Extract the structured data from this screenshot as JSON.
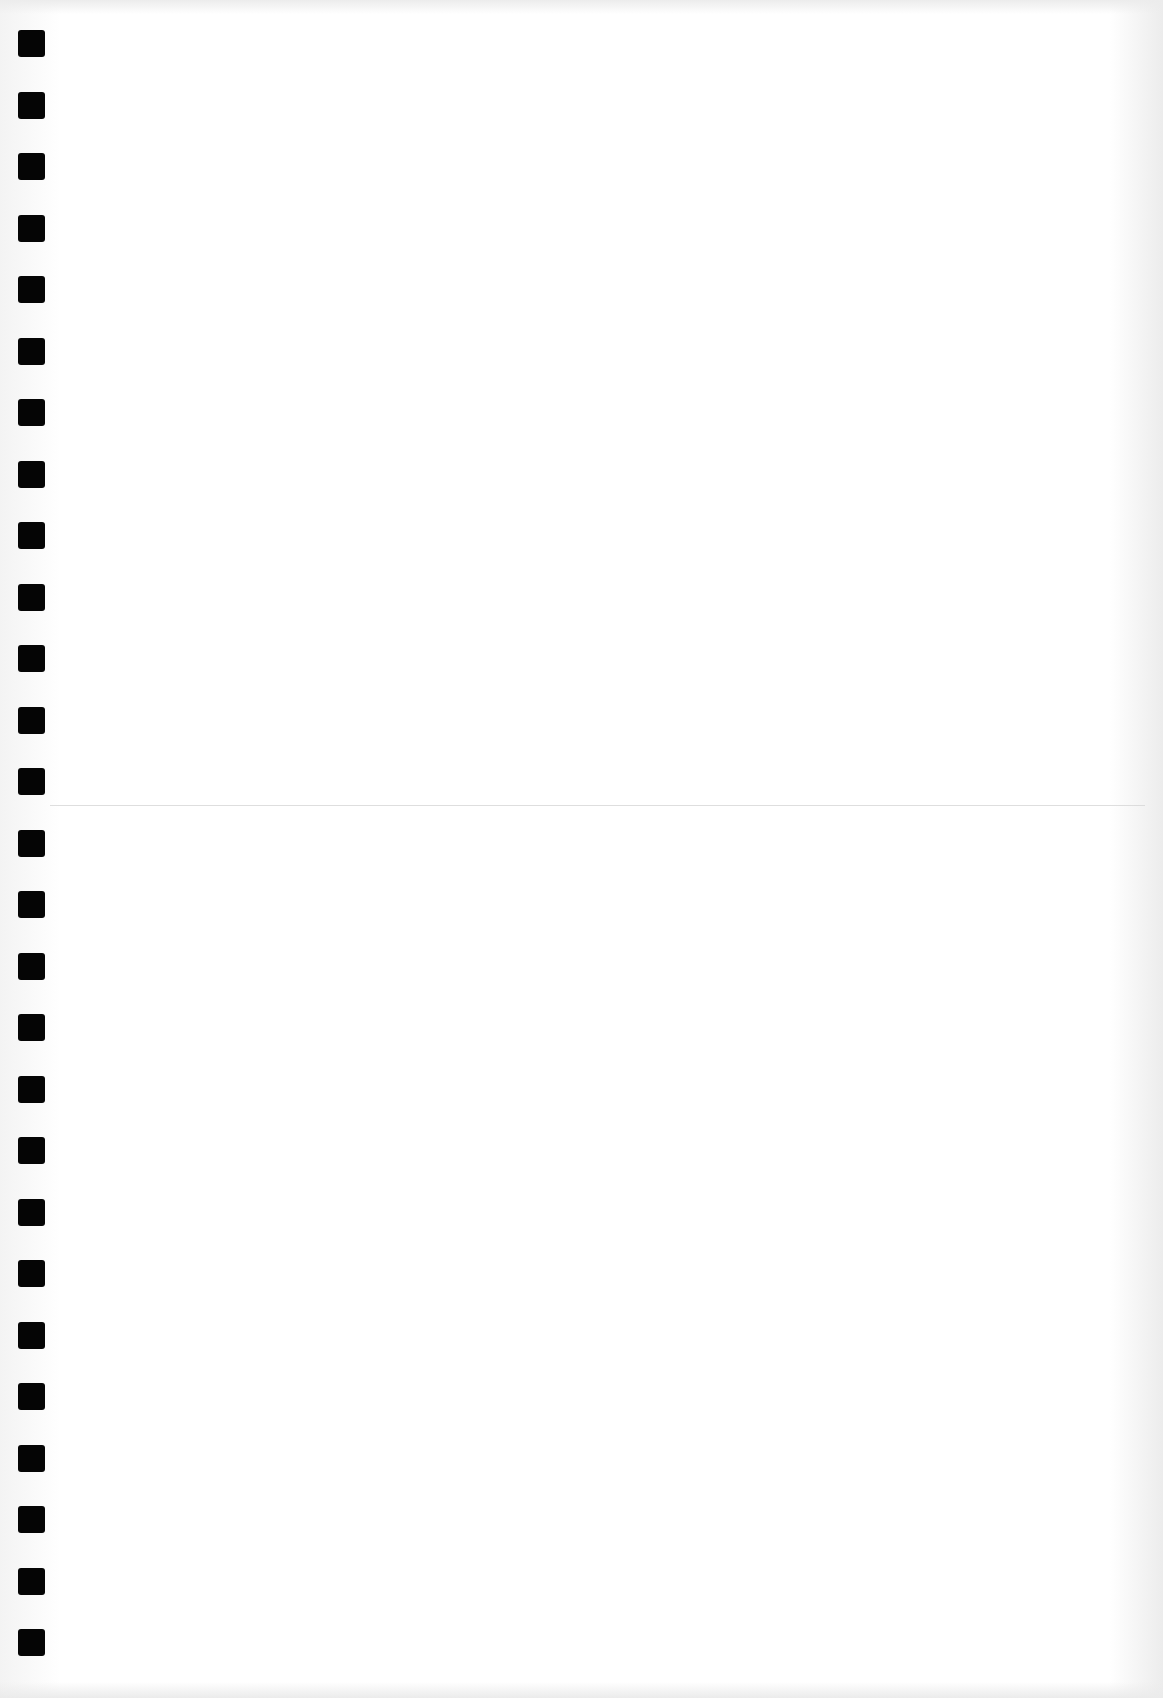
{
  "page": {
    "type": "blank-punched-sheet",
    "text_content": "",
    "background_color": "#ffffff",
    "hole_color": "#050505",
    "hole_count": 27,
    "hole_size_px": 27,
    "hole_left_px": 18,
    "hole_first_top_px": 30,
    "hole_pitch_px": 61.5,
    "fold_line_top_px": 805
  }
}
